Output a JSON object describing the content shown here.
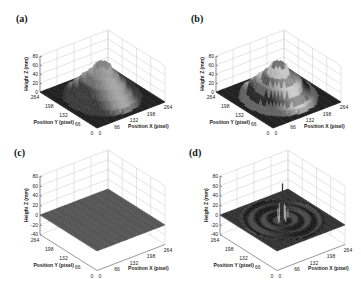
{
  "figure": {
    "panels": [
      {
        "id": "a",
        "label": "(a)",
        "zlim": [
          0,
          80
        ],
        "zticks": [
          "0",
          "20",
          "40",
          "60",
          "80"
        ],
        "surface": "stepped-cone-tall",
        "note": "measured height map, stepped conical object"
      },
      {
        "id": "b",
        "label": "(b)",
        "zlim": [
          0,
          80
        ],
        "zticks": [
          "0",
          "20",
          "40",
          "60",
          "80"
        ],
        "surface": "stepped-cone-banded",
        "note": "reconstructed height map with banding"
      },
      {
        "id": "c",
        "label": "(c)",
        "zlim": [
          -40,
          80
        ],
        "zticks": [
          "-40",
          "-20",
          "0",
          "20",
          "40",
          "60",
          "80"
        ],
        "surface": "flat",
        "note": "flat plane at Z≈0"
      },
      {
        "id": "d",
        "label": "(d)",
        "zlim": [
          -40,
          80
        ],
        "zticks": [
          "-40",
          "-20",
          "0",
          "20",
          "40",
          "60",
          "80"
        ],
        "surface": "ripples-with-spikes",
        "note": "error map with concentric ripples and spikes"
      }
    ],
    "axes": {
      "xlabel": "Position X (pixel)",
      "ylabel": "Position Y (pixel)",
      "zlabel": "Height Z (mm)",
      "xticks": [
        "0",
        "66",
        "132",
        "198",
        "264"
      ],
      "yticks": [
        "0",
        "66",
        "132",
        "198",
        "264"
      ]
    }
  },
  "chart_data": [
    {
      "type": "surface3d",
      "title": "(a)",
      "xlabel": "Position X (pixel)",
      "ylabel": "Position Y (pixel)",
      "zlabel": "Height Z (mm)",
      "xlim": [
        0,
        264
      ],
      "ylim": [
        0,
        264
      ],
      "zlim": [
        0,
        80
      ],
      "xticks": [
        0,
        66,
        132,
        198,
        264
      ],
      "yticks": [
        0,
        66,
        132,
        198,
        264
      ],
      "zticks": [
        0,
        20,
        40,
        60,
        80
      ],
      "grid": true,
      "description": "Stepped conical object centered at (132,132); peak height ~75 mm; base radius ~110 px"
    },
    {
      "type": "surface3d",
      "title": "(b)",
      "xlabel": "Position X (pixel)",
      "ylabel": "Position Y (pixel)",
      "zlabel": "Height Z (mm)",
      "xlim": [
        0,
        264
      ],
      "ylim": [
        0,
        264
      ],
      "zlim": [
        0,
        80
      ],
      "xticks": [
        0,
        66,
        132,
        198,
        264
      ],
      "yticks": [
        0,
        66,
        132,
        198,
        264
      ],
      "zticks": [
        0,
        20,
        40,
        60,
        80
      ],
      "grid": true,
      "description": "Stepped conical object with light/dark banding; peak ~78 mm"
    },
    {
      "type": "surface3d",
      "title": "(c)",
      "xlabel": "Position X (pixel)",
      "ylabel": "Position Y (pixel)",
      "zlabel": "Height Z (mm)",
      "xlim": [
        0,
        264
      ],
      "ylim": [
        0,
        264
      ],
      "zlim": [
        -40,
        80
      ],
      "xticks": [
        0,
        66,
        132,
        198,
        264
      ],
      "yticks": [
        0,
        66,
        132,
        198,
        264
      ],
      "zticks": [
        -40,
        -20,
        0,
        20,
        40,
        60,
        80
      ],
      "grid": true,
      "description": "Flat plane at Z = 0"
    },
    {
      "type": "surface3d",
      "title": "(d)",
      "xlabel": "Position X (pixel)",
      "ylabel": "Position Y (pixel)",
      "zlabel": "Height Z (mm)",
      "xlim": [
        0,
        264
      ],
      "ylim": [
        0,
        264
      ],
      "zlim": [
        -40,
        80
      ],
      "xticks": [
        0,
        66,
        132,
        198,
        264
      ],
      "yticks": [
        0,
        66,
        132,
        198,
        264
      ],
      "zticks": [
        -40,
        -20,
        0,
        20,
        40,
        60,
        80
      ],
      "grid": true,
      "description": "Near-zero surface with concentric ripples and spikes near center; max spike ~75 mm"
    }
  ]
}
